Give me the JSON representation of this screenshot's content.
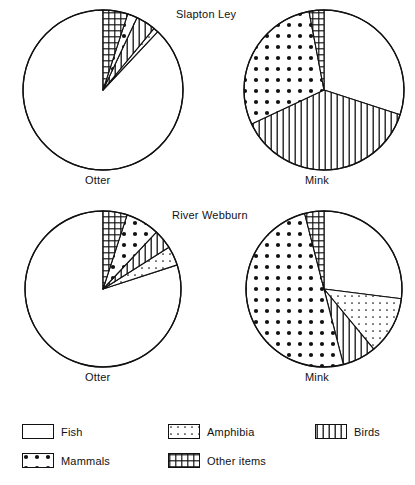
{
  "figure": {
    "width": 415,
    "height": 485,
    "background": "#ffffff",
    "ink": "#111111"
  },
  "sites": [
    {
      "key": "slapton",
      "title": "Slapton Ley"
    },
    {
      "key": "webburn",
      "title": "River Webburn"
    }
  ],
  "animals": [
    {
      "key": "otter",
      "label": "Otter"
    },
    {
      "key": "mink",
      "label": "Mink"
    }
  ],
  "panel_labels": {
    "otter_slapton": "Otter",
    "mink_slapton": "Mink",
    "otter_webburn": "Otter",
    "mink_webburn": "Mink"
  },
  "legend": {
    "position": "bottom",
    "items": [
      {
        "label": "Fish",
        "pattern": "blank"
      },
      {
        "label": "Amphibia",
        "pattern": "fine-dots"
      },
      {
        "label": "Birds",
        "pattern": "vertical-lines"
      },
      {
        "label": "Mammals",
        "pattern": "coarse-dots"
      },
      {
        "label": "Other items",
        "pattern": "grid"
      }
    ]
  },
  "chart_data": [
    {
      "type": "pie",
      "title": "Slapton Ley",
      "subtitle": "Otter",
      "categories": [
        "Fish",
        "Amphibia",
        "Birds",
        "Mammals",
        "Other items"
      ],
      "values": [
        88,
        1,
        4,
        2,
        5
      ],
      "unit": "percent of diet",
      "start_angle_deg": 0,
      "direction": "counterclockwise",
      "xlabel": "",
      "ylabel": ""
    },
    {
      "type": "pie",
      "title": "Slapton Ley",
      "subtitle": "Mink",
      "categories": [
        "Fish",
        "Amphibia",
        "Birds",
        "Mammals",
        "Other items"
      ],
      "values": [
        30,
        0,
        38,
        29,
        3
      ],
      "unit": "percent of diet",
      "start_angle_deg": 0,
      "direction": "clockwise",
      "xlabel": "",
      "ylabel": ""
    },
    {
      "type": "pie",
      "title": "River Webburn",
      "subtitle": "Otter",
      "categories": [
        "Fish",
        "Amphibia",
        "Birds",
        "Mammals",
        "Other items"
      ],
      "values": [
        80,
        4,
        4,
        7,
        5
      ],
      "unit": "percent of diet",
      "start_angle_deg": 0,
      "direction": "counterclockwise",
      "xlabel": "",
      "ylabel": ""
    },
    {
      "type": "pie",
      "title": "River Webburn",
      "subtitle": "Mink",
      "categories": [
        "Fish",
        "Amphibia",
        "Birds",
        "Mammals",
        "Other items"
      ],
      "values": [
        27,
        12,
        7,
        50,
        4
      ],
      "unit": "percent of diet",
      "start_angle_deg": 0,
      "direction": "clockwise",
      "xlabel": "",
      "ylabel": ""
    }
  ],
  "geometry": {
    "pies": [
      {
        "name": "otter-slapton",
        "cx": 103,
        "cy": 90,
        "r": 80
      },
      {
        "name": "mink-slapton",
        "cx": 324,
        "cy": 90,
        "r": 80
      },
      {
        "name": "otter-webburn",
        "cx": 103,
        "cy": 289,
        "r": 78
      },
      {
        "name": "mink-webburn",
        "cx": 324,
        "cy": 289,
        "r": 78
      }
    ]
  }
}
